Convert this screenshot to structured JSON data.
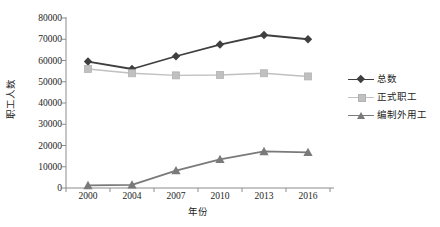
{
  "chart_data": {
    "type": "line",
    "title": "",
    "xlabel": "年份",
    "ylabel": "职工人数",
    "categories": [
      "2000",
      "2004",
      "2007",
      "2010",
      "2013",
      "2016"
    ],
    "x": [
      2000,
      2004,
      2007,
      2010,
      2013,
      2016
    ],
    "ylim": [
      0,
      80000
    ],
    "yticks": [
      0,
      10000,
      20000,
      30000,
      40000,
      50000,
      60000,
      70000,
      80000
    ],
    "ytick_labels": [
      "0",
      "10000",
      "20000",
      "30000",
      "40000",
      "50000",
      "60000",
      "70000",
      "80000"
    ],
    "grid": false,
    "legend_position": "right",
    "series": [
      {
        "name": "总数",
        "marker": "diamond",
        "color": "#3f3f3f",
        "values": [
          59500,
          56000,
          62000,
          67500,
          72000,
          70000
        ]
      },
      {
        "name": "正式职工",
        "marker": "square",
        "color": "#c0c0c0",
        "values": [
          56000,
          54000,
          53000,
          53200,
          54000,
          52500
        ]
      },
      {
        "name": "编制外用工",
        "marker": "triangle",
        "color": "#7a7a7a",
        "values": [
          1200,
          1500,
          8200,
          13500,
          17200,
          16800
        ]
      }
    ]
  },
  "axis": {
    "y_title": "职工人数",
    "x_title": "年份",
    "ytick_labels": [
      "80000",
      "70000",
      "60000",
      "50000",
      "40000",
      "30000",
      "20000",
      "10000",
      "0"
    ],
    "xtick_labels": [
      "2000",
      "2004",
      "2007",
      "2010",
      "2013",
      "2016"
    ]
  },
  "legend": {
    "items": [
      {
        "label": "总数",
        "color": "#3f3f3f",
        "marker": "diamond-marker"
      },
      {
        "label": "正式职工",
        "color": "#c0c0c0",
        "marker": "square-marker"
      },
      {
        "label": "编制外用工",
        "color": "#7a7a7a",
        "marker": "triangle-marker"
      }
    ]
  },
  "colors": {
    "axis": "#8c8c8c",
    "text": "#1d1d1d",
    "background": "#ffffff",
    "series_total": "#3f3f3f",
    "series_regular": "#c0c0c0",
    "series_contract": "#7a7a7a"
  }
}
